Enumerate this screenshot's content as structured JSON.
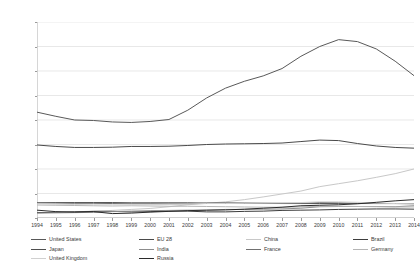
{
  "chart_data": {
    "type": "line",
    "title": "",
    "xlabel": "",
    "ylabel": "US $bn., constant 2011 prices",
    "x": [
      1994,
      1995,
      1996,
      1997,
      1998,
      1999,
      2000,
      2001,
      2002,
      2003,
      2004,
      2005,
      2006,
      2007,
      2008,
      2009,
      2010,
      2011,
      2012,
      2013,
      2014
    ],
    "xtick_labels": [
      "1994",
      "1995",
      "1996",
      "1997",
      "1998",
      "1999",
      "2000",
      "2001",
      "2002",
      "2003",
      "2004",
      "2005",
      "2006",
      "2007",
      "2008",
      "2009",
      "2010",
      "2011",
      "2012",
      "2013",
      "2014"
    ],
    "ytick_labels": [
      "0",
      "100",
      "200",
      "300",
      "400",
      "500",
      "600",
      "700",
      "800"
    ],
    "yticks": [
      0,
      100,
      200,
      300,
      400,
      500,
      600,
      700,
      800
    ],
    "ylim": [
      0,
      800
    ],
    "grid": "horizontal",
    "legend_position": "bottom",
    "legend_columns": 4,
    "legend_rows": 3,
    "series": [
      {
        "name": "United States",
        "color": "#595959",
        "width": 1.0,
        "values": [
          432,
          415,
          400,
          398,
          392,
          390,
          394,
          402,
          440,
          490,
          530,
          558,
          580,
          610,
          660,
          700,
          728,
          720,
          690,
          640,
          581
        ]
      },
      {
        "name": "EU 28",
        "color": "#4a4a4a",
        "width": 1.0,
        "values": [
          298,
          292,
          288,
          288,
          289,
          292,
          292,
          293,
          296,
          300,
          302,
          303,
          304,
          306,
          312,
          318,
          316,
          304,
          294,
          288,
          285
        ]
      },
      {
        "name": "China",
        "color": "#c8c8c8",
        "width": 1.0,
        "values": [
          21,
          23,
          25,
          28,
          31,
          35,
          39,
          46,
          54,
          60,
          66,
          75,
          86,
          98,
          110,
          128,
          140,
          152,
          166,
          181,
          200
        ]
      },
      {
        "name": "Brazil",
        "color": "#3d3d3d",
        "width": 1.0,
        "values": [
          22,
          23,
          25,
          27,
          27,
          25,
          26,
          28,
          28,
          25,
          25,
          27,
          28,
          31,
          32,
          33,
          35,
          36,
          37,
          37,
          36
        ]
      },
      {
        "name": "Japan",
        "color": "#4f4f4f",
        "width": 1.0,
        "values": [
          62,
          63,
          63,
          63,
          63,
          62,
          62,
          62,
          62,
          61,
          61,
          60,
          60,
          59,
          59,
          59,
          59,
          59,
          59,
          59,
          59
        ]
      },
      {
        "name": "India",
        "color": "#8c8c8c",
        "width": 1.0,
        "values": [
          20,
          21,
          22,
          23,
          26,
          28,
          30,
          31,
          32,
          32,
          35,
          35,
          36,
          37,
          40,
          46,
          47,
          47,
          47,
          46,
          50
        ]
      },
      {
        "name": "France",
        "color": "#707070",
        "width": 1.0,
        "values": [
          62,
          61,
          60,
          60,
          59,
          58,
          58,
          57,
          58,
          60,
          61,
          61,
          60,
          60,
          60,
          63,
          62,
          60,
          59,
          59,
          58
        ]
      },
      {
        "name": "Germany",
        "color": "#b5b5b5",
        "width": 1.0,
        "values": [
          53,
          52,
          51,
          50,
          49,
          50,
          49,
          48,
          48,
          47,
          46,
          45,
          44,
          44,
          45,
          48,
          48,
          47,
          46,
          45,
          45
        ]
      },
      {
        "name": "United Kingdom",
        "color": "#d0d0d0",
        "width": 1.0,
        "values": [
          58,
          56,
          55,
          54,
          54,
          53,
          54,
          55,
          57,
          59,
          59,
          60,
          61,
          62,
          63,
          66,
          66,
          64,
          61,
          59,
          58
        ]
      },
      {
        "name": "Russia",
        "color": "#2b2b2b",
        "width": 1.0,
        "values": [
          32,
          26,
          24,
          26,
          18,
          20,
          24,
          27,
          30,
          32,
          33,
          36,
          40,
          44,
          50,
          52,
          54,
          58,
          64,
          70,
          75
        ]
      }
    ]
  },
  "axis": {
    "y_title": "US $bn., constant 2011 prices"
  }
}
